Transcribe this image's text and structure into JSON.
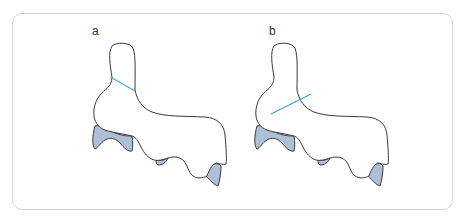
{
  "figure": {
    "panels": [
      {
        "label": "a",
        "line_description": "blue line across upper neck of outline (higher, sloping down to right)"
      },
      {
        "label": "b",
        "line_description": "blue line across lower base of neck (sloping up to right)"
      }
    ],
    "colors": {
      "outline": "#3a3a3a",
      "guide_line": "#4aa3d8",
      "fill": "#aebfd6",
      "frame_border": "#d4d4d4"
    }
  }
}
